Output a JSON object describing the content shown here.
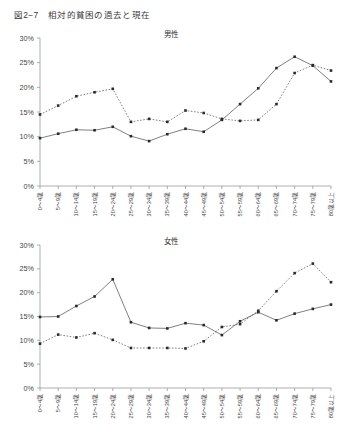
{
  "figure": {
    "number": "図2−7",
    "title": "相対的貧困の過去と現在",
    "full_title": "図2−7　相対的貧困の過去と現在"
  },
  "axis": {
    "y_ticks": [
      "0%",
      "5%",
      "10%",
      "15%",
      "20%",
      "25%",
      "30%"
    ],
    "x_categories": [
      "0〜4歳",
      "5〜9歳",
      "10〜14歳",
      "15〜19歳",
      "20〜24歳",
      "25〜29歳",
      "30〜34歳",
      "35〜39歳",
      "40〜44歳",
      "45〜49歳",
      "50〜54歳",
      "55〜59歳",
      "60〜64歳",
      "65〜69歳",
      "70〜74歳",
      "75〜79歳",
      "80歳以上"
    ]
  },
  "panels": [
    {
      "id": "male",
      "title": "男性"
    },
    {
      "id": "female",
      "title": "女性"
    }
  ],
  "chart_data": [
    {
      "type": "line",
      "title": "男性",
      "xlabel": "",
      "ylabel": "",
      "ylim": [
        0,
        30
      ],
      "yticks": [
        0,
        5,
        10,
        15,
        20,
        25,
        30
      ],
      "ytick_labels": [
        "0%",
        "5%",
        "10%",
        "15%",
        "20%",
        "25%",
        "30%"
      ],
      "grid": false,
      "legend": "none",
      "categories": [
        "0〜4歳",
        "5〜9歳",
        "10〜14歳",
        "15〜19歳",
        "20〜24歳",
        "25〜29歳",
        "30〜34歳",
        "35〜39歳",
        "40〜44歳",
        "45〜49歳",
        "50〜54歳",
        "55〜59歳",
        "60〜64歳",
        "65〜69歳",
        "70〜74歳",
        "75〜79歳",
        "80歳以上"
      ],
      "series": [
        {
          "name": "過去",
          "style": "dotted",
          "values": [
            14.5,
            16.3,
            18.2,
            19.0,
            19.7,
            13.0,
            13.6,
            13.0,
            15.3,
            14.8,
            13.6,
            13.2,
            13.4,
            16.6,
            22.9,
            24.5,
            23.4
          ]
        },
        {
          "name": "現在",
          "style": "solid",
          "values": [
            9.7,
            10.6,
            11.4,
            11.3,
            12.0,
            10.1,
            9.1,
            10.5,
            11.6,
            11.0,
            13.4,
            16.6,
            19.8,
            23.9,
            26.2,
            24.4,
            21.2
          ]
        }
      ]
    },
    {
      "type": "line",
      "title": "女性",
      "xlabel": "",
      "ylabel": "",
      "ylim": [
        0,
        30
      ],
      "yticks": [
        0,
        5,
        10,
        15,
        20,
        25,
        30
      ],
      "ytick_labels": [
        "0%",
        "5%",
        "10%",
        "15%",
        "20%",
        "25%",
        "30%"
      ],
      "grid": false,
      "legend": "none",
      "categories": [
        "0〜4歳",
        "5〜9歳",
        "10〜14歳",
        "15〜19歳",
        "20〜24歳",
        "25〜29歳",
        "30〜34歳",
        "35〜39歳",
        "40〜44歳",
        "45〜49歳",
        "50〜54歳",
        "55〜59歳",
        "60〜64歳",
        "65〜69歳",
        "70〜74歳",
        "75〜79歳",
        "80歳以上"
      ],
      "series": [
        {
          "name": "過去",
          "style": "solid",
          "values": [
            14.9,
            15.0,
            17.2,
            19.2,
            22.8,
            13.8,
            12.6,
            12.5,
            13.6,
            13.2,
            11.1,
            14.0,
            15.9,
            14.2,
            15.6,
            16.6,
            17.5
          ]
        },
        {
          "name": "現在",
          "style": "dotted",
          "values": [
            9.3,
            11.2,
            10.6,
            11.5,
            10.1,
            8.4,
            8.4,
            8.4,
            8.3,
            9.8,
            12.8,
            13.4,
            16.2,
            20.3,
            24.1,
            26.1,
            22.2
          ]
        }
      ]
    }
  ]
}
